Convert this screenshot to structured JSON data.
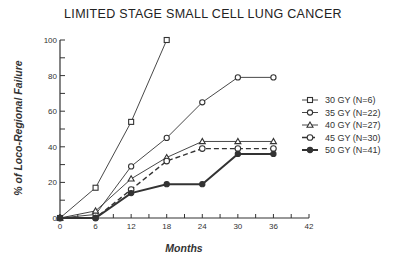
{
  "chart_data": {
    "type": "line",
    "title": "LIMITED STAGE SMALL CELL LUNG CANCER",
    "xlabel": "Months",
    "ylabel": "% of Loco-Regional Failure",
    "x_ticks": [
      0,
      6,
      12,
      18,
      24,
      30,
      36,
      42
    ],
    "y_ticks": [
      0,
      20,
      40,
      60,
      80,
      100
    ],
    "xlim": [
      0,
      42
    ],
    "ylim": [
      0,
      100
    ],
    "grid": false,
    "legend_position": "right",
    "series": [
      {
        "name": "30 GY (N=6)",
        "marker": "square",
        "line": "solid-thin",
        "x": [
          0,
          6,
          12,
          18
        ],
        "values": [
          0,
          17,
          54,
          100
        ]
      },
      {
        "name": "35 GY (N=22)",
        "marker": "diamond",
        "line": "solid-thin",
        "x": [
          0,
          6,
          12,
          18,
          24,
          30,
          36
        ],
        "values": [
          0,
          2,
          29,
          45,
          65,
          79,
          79
        ]
      },
      {
        "name": "40 GY (N=27)",
        "marker": "triangle",
        "line": "solid-thin",
        "x": [
          0,
          6,
          12,
          18,
          24,
          30,
          36
        ],
        "values": [
          0,
          4,
          22,
          34,
          43,
          43,
          43
        ]
      },
      {
        "name": "45 GY (N=30)",
        "marker": "circle",
        "line": "dashed",
        "x": [
          0,
          6,
          12,
          18,
          24,
          30,
          36
        ],
        "values": [
          0,
          0,
          16,
          32,
          39,
          39,
          39
        ]
      },
      {
        "name": "50 GY (N=41)",
        "marker": "filled-circle",
        "line": "solid-thick",
        "x": [
          0,
          6,
          12,
          18,
          24,
          30,
          36
        ],
        "values": [
          0,
          0,
          14,
          19,
          19,
          36,
          36
        ]
      }
    ]
  },
  "colors": {
    "ink": "#333333",
    "background": "#ffffff"
  }
}
